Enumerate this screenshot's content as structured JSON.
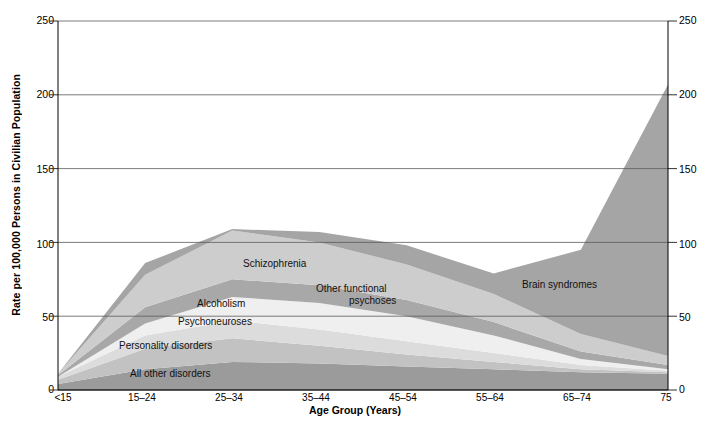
{
  "chart_data": {
    "type": "area",
    "stacked": true,
    "title": "",
    "xlabel": "Age Group (Years)",
    "ylabel": "Rate per 100,000 Persons in Civilian Population",
    "categories": [
      "<15",
      "15–24",
      "25–34",
      "35–44",
      "45–54",
      "55–64",
      "65–74",
      "75"
    ],
    "ylim": [
      0,
      250
    ],
    "yticks": [
      0,
      50,
      100,
      150,
      200,
      250
    ],
    "ytick_labels_left": [
      "0",
      "50",
      "100",
      "150",
      "200",
      "250"
    ],
    "ytick_labels_right": [
      "0",
      "50",
      "100",
      "150",
      "200",
      "250"
    ],
    "grid": true,
    "legend_position": "inline-annotations",
    "series": [
      {
        "name": "All other disorders",
        "color": "#9b9b9b",
        "values": [
          4,
          14,
          19,
          18,
          16,
          14,
          12,
          11
        ]
      },
      {
        "name": "Personality disorders",
        "color": "#c2c2c2",
        "values": [
          3,
          14,
          16,
          12,
          8,
          5,
          2,
          1
        ]
      },
      {
        "name": "Psychoneuroses",
        "color": "#dcdcdc",
        "values": [
          2,
          9,
          12,
          11,
          9,
          6,
          3,
          1
        ]
      },
      {
        "name": "Alcoholism",
        "color": "#efefef",
        "values": [
          0,
          8,
          16,
          18,
          17,
          12,
          4,
          1
        ]
      },
      {
        "name": "Other functional psychoses",
        "color": "#a8a8a8",
        "values": [
          1,
          11,
          12,
          12,
          11,
          9,
          5,
          3
        ]
      },
      {
        "name": "Schizophrenia",
        "color": "#cdcdcd",
        "values": [
          1,
          22,
          33,
          29,
          24,
          19,
          12,
          6
        ]
      },
      {
        "name": "Brain syndromes",
        "color": "#a5a5a5",
        "values": [
          0,
          8,
          1,
          7,
          13,
          14,
          57,
          184
        ]
      }
    ],
    "totals": [
      11,
      86,
      109,
      107,
      98,
      79,
      95,
      207
    ],
    "annotations": [
      {
        "text": "Schizophrenia",
        "x": 243,
        "y": 263
      },
      {
        "text": "Alcoholism",
        "x": 197,
        "y": 303
      },
      {
        "text": "Other functional",
        "x": 318,
        "y": 288
      },
      {
        "text": "psychoses",
        "x": 345,
        "y": 300
      },
      {
        "text": "Psychoneuroses",
        "x": 178,
        "y": 321
      },
      {
        "text": "Personality disorders",
        "x": 119,
        "y": 345
      },
      {
        "text": "All other disorders",
        "x": 130,
        "y": 373
      },
      {
        "text": "Brain syndromes",
        "x": 522,
        "y": 284
      }
    ]
  },
  "axis": {
    "left_ticks": [
      "250",
      "200",
      "150",
      "100",
      "50",
      "0"
    ],
    "right_ticks": [
      "250",
      "200",
      "150",
      "100",
      "50",
      "0"
    ],
    "x_ticks": [
      "<15",
      "15–24",
      "25–34",
      "35–44",
      "45–54",
      "55–64",
      "65–74",
      "75"
    ],
    "x_title": "Age Group (Years)",
    "y_title": "Rate per 100,000 Persons in Civilian Population"
  },
  "colors": {
    "gridline": "#5a5a5a",
    "axis": "#000000",
    "plot_background": "#ffffff",
    "band_all_other": "#9b9b9b",
    "band_personality": "#c2c2c2",
    "band_psychoneuroses": "#dcdcdc",
    "band_alcoholism": "#efefef",
    "band_other_psychoses": "#a8a8a8",
    "band_schizophrenia": "#cdcdcd",
    "band_brain": "#a5a5a5"
  }
}
